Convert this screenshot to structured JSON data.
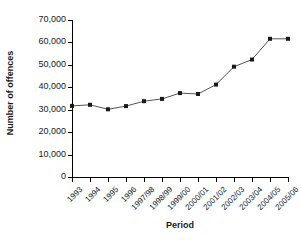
{
  "chart_data": {
    "type": "line",
    "title": "",
    "xlabel": "Period",
    "ylabel": "Number of offences",
    "categories": [
      "1993",
      "1994",
      "1995",
      "1996",
      "1997/98",
      "1998/99",
      "1999/00",
      "2000/01",
      "2001/02",
      "2002/03",
      "2003/04",
      "2004/05",
      "2005/06"
    ],
    "values": [
      31700,
      32200,
      30200,
      31600,
      33800,
      34800,
      37400,
      37000,
      41200,
      49200,
      52400,
      61600,
      61600
    ],
    "series": [
      {
        "name": "Number of offences",
        "values": [
          31700,
          32200,
          30200,
          31600,
          33800,
          34800,
          37400,
          37000,
          41200,
          49200,
          52400,
          61600,
          61600
        ]
      }
    ],
    "ylim": [
      0,
      70000
    ],
    "ytick_labels": [
      "0",
      "10,000",
      "20,000",
      "30,000",
      "40,000",
      "50,000",
      "60,000",
      "70,000"
    ],
    "ytick_values": [
      0,
      10000,
      20000,
      30000,
      40000,
      50000,
      60000,
      70000
    ],
    "grid": false,
    "legend": "none",
    "marker": "square",
    "line_color": "#555555",
    "marker_color": "#1a1a1a"
  }
}
